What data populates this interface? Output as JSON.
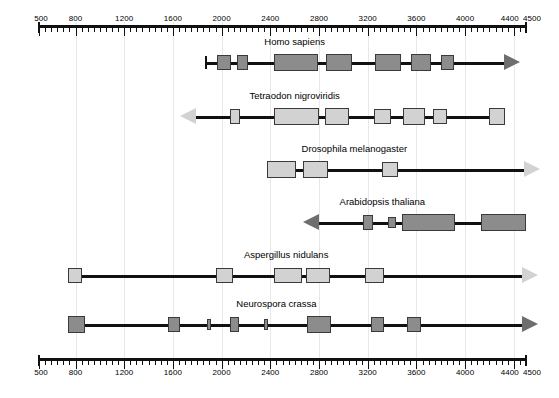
{
  "figure": {
    "type": "gene-structure-comparison",
    "width": 559,
    "height": 398
  },
  "axis": {
    "unit_hint": "",
    "min": 500,
    "max": 4500,
    "major_step": 400,
    "minor_step": 50,
    "tick_labels": [
      "500",
      "800",
      "1200",
      "1600",
      "2000",
      "2400",
      "2800",
      "3200",
      "3600",
      "4000",
      "4400",
      "4500"
    ],
    "tick_values": [
      500,
      800,
      1200,
      1600,
      2000,
      2400,
      2800,
      3200,
      3600,
      4000,
      4400,
      4500
    ],
    "gridline_values": [
      800,
      1200,
      1600,
      2000,
      2400,
      2800,
      3200,
      3600,
      4000,
      4400
    ],
    "top_axis_name": "top-axis",
    "bottom_axis_name": "bottom-axis"
  },
  "colors": {
    "backbone": "#111111",
    "box_dark": "#8c8c8c",
    "box_light": "#d2d2d2",
    "box_border": "#3a3a3a",
    "arrow_dark": "#6e6e6e",
    "arrow_light": "#d2d2d2",
    "gridline": "#e8e8e8",
    "text": "#000000",
    "background": "#ffffff"
  },
  "tracks": [
    {
      "id": "homo-sapiens",
      "label": "Homo sapiens",
      "label_at": 2600,
      "top": 36,
      "line_start": 1870,
      "line_end": 4320,
      "start_cap": "tbar",
      "end_arrow": {
        "direction": "right",
        "at": 4320,
        "shade": "dark"
      },
      "boxes": [
        {
          "start": 1960,
          "end": 2080,
          "shade": "dark",
          "size": "normal"
        },
        {
          "start": 2130,
          "end": 2215,
          "shade": "dark",
          "size": "normal"
        },
        {
          "start": 2430,
          "end": 2790,
          "shade": "dark",
          "size": "tall"
        },
        {
          "start": 2855,
          "end": 3070,
          "shade": "dark",
          "size": "tall"
        },
        {
          "start": 3260,
          "end": 3475,
          "shade": "dark",
          "size": "tall"
        },
        {
          "start": 3555,
          "end": 3720,
          "shade": "dark",
          "size": "tall"
        },
        {
          "start": 3800,
          "end": 3910,
          "shade": "dark",
          "size": "normal"
        }
      ]
    },
    {
      "id": "tetraodon-nigroviridis",
      "label": "Tetraodon nigroviridis",
      "label_at": 2600,
      "top": 90,
      "line_start": 1790,
      "line_end": 4320,
      "start_cap": "none",
      "start_arrow": {
        "direction": "left",
        "at": 1790,
        "shade": "light"
      },
      "boxes": [
        {
          "start": 2070,
          "end": 2155,
          "shade": "light",
          "size": "normal"
        },
        {
          "start": 2430,
          "end": 2800,
          "shade": "light",
          "size": "tall"
        },
        {
          "start": 2850,
          "end": 3050,
          "shade": "light",
          "size": "tall"
        },
        {
          "start": 3250,
          "end": 3390,
          "shade": "light",
          "size": "normal"
        },
        {
          "start": 3490,
          "end": 3670,
          "shade": "light",
          "size": "tall"
        },
        {
          "start": 3740,
          "end": 3850,
          "shade": "light",
          "size": "normal"
        },
        {
          "start": 4200,
          "end": 4330,
          "shade": "light",
          "size": "tall"
        }
      ]
    },
    {
      "id": "drosophila-melanogaster",
      "label": "Drosophila melanogaster",
      "label_at": 3090,
      "top": 143,
      "line_start": 2370,
      "line_end": 4480,
      "start_cap": "none",
      "end_arrow": {
        "direction": "right",
        "at": 4480,
        "shade": "light"
      },
      "boxes": [
        {
          "start": 2370,
          "end": 2610,
          "shade": "light",
          "size": "tall"
        },
        {
          "start": 2670,
          "end": 2875,
          "shade": "light",
          "size": "tall"
        },
        {
          "start": 3320,
          "end": 3450,
          "shade": "light",
          "size": "normal"
        }
      ]
    },
    {
      "id": "arabidopsis-thaliana",
      "label": "Arabidopsis thaliana",
      "label_at": 3320,
      "top": 196,
      "line_start": 2800,
      "line_end": 4500,
      "start_cap": "none",
      "start_arrow": {
        "direction": "left",
        "at": 2800,
        "shade": "dark"
      },
      "boxes": [
        {
          "start": 3165,
          "end": 3240,
          "shade": "dark",
          "size": "normal"
        },
        {
          "start": 3370,
          "end": 3430,
          "shade": "dark",
          "size": "slim"
        },
        {
          "start": 3480,
          "end": 3920,
          "shade": "dark",
          "size": "tall"
        },
        {
          "start": 4130,
          "end": 4500,
          "shade": "dark",
          "size": "tall"
        }
      ]
    },
    {
      "id": "aspergillus-nidulans",
      "label": "Aspergillus nidulans",
      "label_at": 2530,
      "top": 249,
      "line_start": 740,
      "line_end": 4470,
      "start_cap": "none",
      "end_arrow": {
        "direction": "right",
        "at": 4470,
        "shade": "light"
      },
      "boxes": [
        {
          "start": 740,
          "end": 850,
          "shade": "light",
          "size": "normal"
        },
        {
          "start": 1950,
          "end": 2090,
          "shade": "light",
          "size": "normal"
        },
        {
          "start": 2430,
          "end": 2660,
          "shade": "light",
          "size": "normal"
        },
        {
          "start": 2690,
          "end": 2890,
          "shade": "light",
          "size": "normal"
        },
        {
          "start": 3180,
          "end": 3330,
          "shade": "light",
          "size": "normal"
        }
      ]
    },
    {
      "id": "neurospora-crassa",
      "label": "Neurospora crassa",
      "label_at": 2450,
      "top": 298,
      "line_start": 740,
      "line_end": 4470,
      "start_cap": "none",
      "end_arrow": {
        "direction": "right",
        "at": 4470,
        "shade": "dark"
      },
      "boxes": [
        {
          "start": 740,
          "end": 880,
          "shade": "dark",
          "size": "tall"
        },
        {
          "start": 1560,
          "end": 1660,
          "shade": "dark",
          "size": "normal"
        },
        {
          "start": 1880,
          "end": 1910,
          "shade": "dark",
          "size": "slim"
        },
        {
          "start": 2070,
          "end": 2140,
          "shade": "dark",
          "size": "normal"
        },
        {
          "start": 2350,
          "end": 2385,
          "shade": "dark",
          "size": "slim"
        },
        {
          "start": 2700,
          "end": 2900,
          "shade": "dark",
          "size": "tall"
        },
        {
          "start": 3230,
          "end": 3330,
          "shade": "dark",
          "size": "normal"
        },
        {
          "start": 3520,
          "end": 3640,
          "shade": "dark",
          "size": "normal"
        }
      ]
    }
  ]
}
